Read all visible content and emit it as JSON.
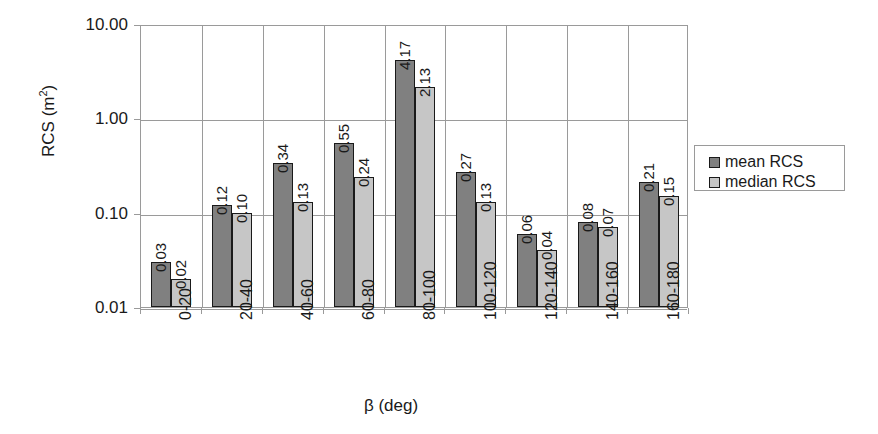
{
  "chart_data": {
    "type": "bar",
    "title": "",
    "xlabel": "β (deg)",
    "ylabel": "RCS (m²)",
    "ylabel_base": "RCS (m",
    "ylabel_sup": "2",
    "ylabel_tail": ")",
    "yscale": "log",
    "ylim": [
      0.01,
      10.0
    ],
    "ytick_labels": [
      "10.00",
      "1.00",
      "0.10",
      "0.01"
    ],
    "ytick_values": [
      10.0,
      1.0,
      0.1,
      0.01
    ],
    "grid": "horizontal and vertical category separators",
    "legend_position": "right",
    "categories": [
      "0-20",
      "20-40",
      "40-60",
      "60-80",
      "80-100",
      "100-120",
      "120-140",
      "140-160",
      "160-180"
    ],
    "series": [
      {
        "name": "mean RCS",
        "color": "#808080",
        "values": [
          0.03,
          0.12,
          0.34,
          0.55,
          4.17,
          0.27,
          0.06,
          0.08,
          0.21
        ],
        "labels": [
          "0.03",
          "0.12",
          "0.34",
          "0.55",
          "4.17",
          "0.27",
          "0.06",
          "0.08",
          "0.21"
        ]
      },
      {
        "name": "median RCS",
        "color": "#c6c6c6",
        "values": [
          0.02,
          0.1,
          0.13,
          0.24,
          2.13,
          0.13,
          0.04,
          0.07,
          0.15
        ],
        "labels": [
          "0.02",
          "0.10",
          "0.13",
          "0.24",
          "2.13",
          "0.13",
          "0.04",
          "0.07",
          "0.15"
        ]
      }
    ]
  },
  "legend": {
    "entries": [
      {
        "label": "mean RCS",
        "color": "#808080"
      },
      {
        "label": "median RCS",
        "color": "#c6c6c6"
      }
    ]
  },
  "colors": {
    "mean": "#808080",
    "median": "#c6c6c6",
    "axis": "#9a9a9a",
    "text": "#1a1a1a",
    "background": "#ffffff"
  }
}
